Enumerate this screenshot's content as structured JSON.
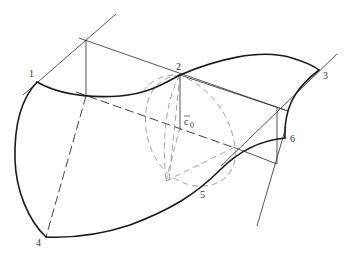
{
  "figure": {
    "points": {
      "p1": {
        "label": "1"
      },
      "p2": {
        "label": "2"
      },
      "p3": {
        "label": "3"
      },
      "p4": {
        "label": "4"
      },
      "p5": {
        "label": "5"
      },
      "p6": {
        "label": "6"
      }
    },
    "vector_label": {
      "base": "c",
      "subscript": "0",
      "overbar": true
    },
    "colors": {
      "stroke": "#1a1a1a",
      "construction": "#2a2a2a",
      "auxiliary_dashed": "#8a8a8a",
      "label": "#333333",
      "background": "#ffffff"
    }
  }
}
